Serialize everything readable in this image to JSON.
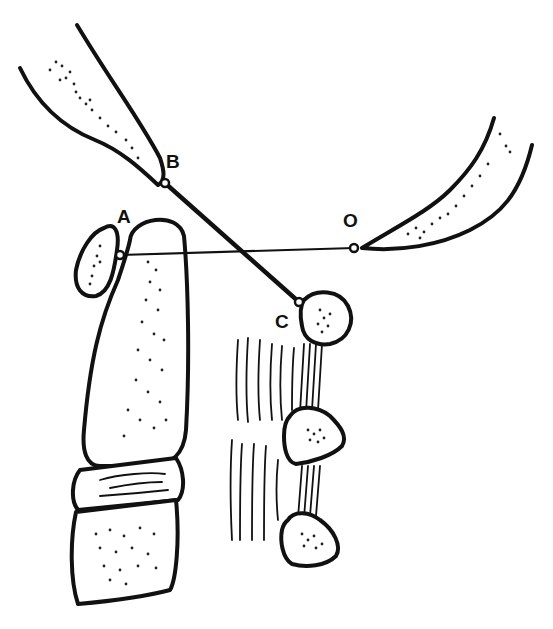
{
  "diagram": {
    "type": "anatomical line drawing",
    "colors": {
      "ink": "#111111",
      "background": "#ffffff"
    },
    "points": [
      {
        "id": "A",
        "label": "A",
        "x": 120,
        "y": 255,
        "label_x": 117,
        "label_y": 223
      },
      {
        "id": "B",
        "label": "B",
        "x": 165,
        "y": 183,
        "label_x": 166,
        "label_y": 168
      },
      {
        "id": "C",
        "label": "C",
        "x": 299,
        "y": 302,
        "label_x": 275,
        "label_y": 328
      },
      {
        "id": "O",
        "label": "O",
        "x": 354,
        "y": 248,
        "label_x": 343,
        "label_y": 227
      }
    ],
    "lines": [
      {
        "from": "A",
        "to": "O",
        "style": "thin"
      },
      {
        "from": "B",
        "to": "C",
        "style": "thick"
      }
    ],
    "structures": [
      "upper-left bone tip (ends at B)",
      "upper-right bone tip (ends at O)",
      "small oval bone at A",
      "long vertical bone",
      "intervertebral disc",
      "lower vertebral body",
      "upper rounded bone at C",
      "middle triangular bone",
      "lower triangular bone",
      "ligament fibers"
    ]
  }
}
